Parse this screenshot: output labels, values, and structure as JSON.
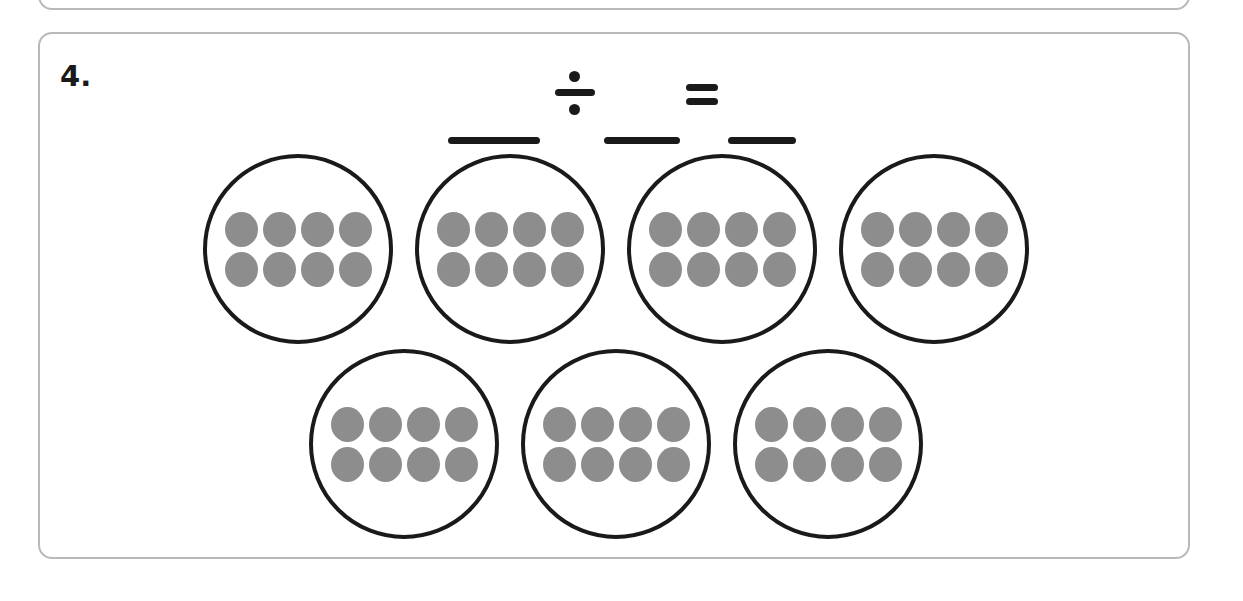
{
  "worksheet": {
    "problem_number": "4.",
    "equation": {
      "blank_1": "",
      "blank_2": "",
      "blank_3": "",
      "division_symbol": "÷",
      "equals_symbol": "="
    },
    "colors": {
      "counter_fill": "#8d8d8d",
      "circle_stroke": "#1a1a1a",
      "box_border": "#b9b9b9",
      "ink": "#1a1a1a",
      "paper": "#ffffff"
    },
    "groups": {
      "total_groups": 7,
      "counters_per_group": 8,
      "counter_grid": {
        "rows": 2,
        "columns": 4
      },
      "total_counters": 56,
      "rows": [
        {
          "row_label": "top-row",
          "circles": [
            {
              "label": "group-1",
              "count": 8
            },
            {
              "label": "group-2",
              "count": 8
            },
            {
              "label": "group-3",
              "count": 8
            },
            {
              "label": "group-4",
              "count": 8
            }
          ]
        },
        {
          "row_label": "bottom-row",
          "circles": [
            {
              "label": "group-5",
              "count": 8
            },
            {
              "label": "group-6",
              "count": 8
            },
            {
              "label": "group-7",
              "count": 8
            }
          ]
        }
      ]
    }
  }
}
